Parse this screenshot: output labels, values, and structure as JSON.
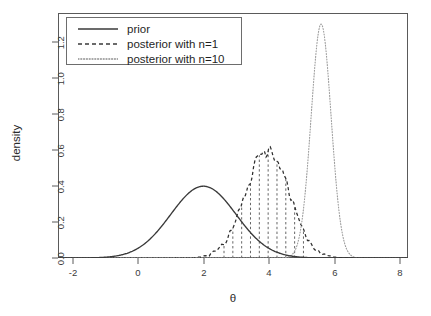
{
  "chart_data": {
    "type": "line",
    "title": "",
    "xlabel": "θ",
    "ylabel": "density",
    "xlim": [
      -2.6,
      8.4
    ],
    "ylim": [
      -0.02,
      1.36
    ],
    "xticks": [
      "-2",
      "0",
      "2",
      "4",
      "6",
      "8"
    ],
    "xtick_values": [
      -2,
      0,
      2,
      4,
      6,
      8
    ],
    "yticks": [
      "0.0",
      "0.2",
      "0.4",
      "0.6",
      "0.8",
      "1.0",
      "1.2"
    ],
    "ytick_values": [
      0.0,
      0.2,
      0.4,
      0.6,
      0.8,
      1.0,
      1.2
    ],
    "grid": false,
    "legend_position": "top-left",
    "series": [
      {
        "name": "prior",
        "linestyle": "solid",
        "color": "#333333",
        "distribution": "normal",
        "mean": 2.0,
        "sd": 1.0,
        "peak_x": 2.0,
        "peak_y": 0.4
      },
      {
        "name": "posterior with n=1",
        "linestyle": "dashed",
        "color": "#333333",
        "shaded": true,
        "shading": "vertical-hatch",
        "distribution": "normal-noisy",
        "mean": 3.95,
        "sd": 0.66,
        "peak_x": 3.95,
        "peak_y": 0.6
      },
      {
        "name": "posterior with n=10",
        "linestyle": "dotted",
        "color": "#9a9a9a",
        "distribution": "normal",
        "mean": 5.6,
        "sd": 0.305,
        "peak_x": 5.6,
        "peak_y": 1.3
      }
    ]
  },
  "legend": {
    "entries": [
      {
        "label": "prior",
        "style": "solid"
      },
      {
        "label": "posterior with n=1",
        "style": "dashed"
      },
      {
        "label": "posterior with n=10",
        "style": "dotted"
      }
    ]
  }
}
